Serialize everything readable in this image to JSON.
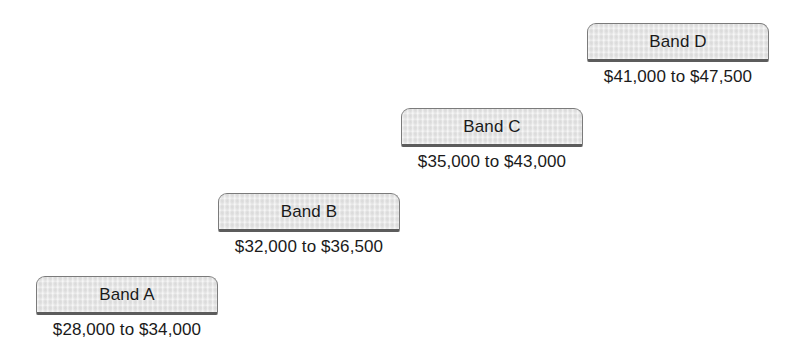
{
  "chart_data": {
    "type": "bar",
    "title": "",
    "subtitle": "",
    "xlabel": "",
    "ylabel": "",
    "categories": [
      "Band A",
      "Band B",
      "Band C",
      "Band D"
    ],
    "series": [
      {
        "name": "Range minimum",
        "values": [
          28000,
          32000,
          35000,
          41000
        ]
      },
      {
        "name": "Range maximum",
        "values": [
          34000,
          36500,
          43000,
          47500
        ]
      }
    ],
    "annotations": [
      "$28,000 to $34,000",
      "$32,000 to $36,500",
      "$35,000 to $43,000",
      "$41,000 to $47,500"
    ],
    "grid": false,
    "legend": "none",
    "ylim": [
      28000,
      47500
    ]
  },
  "diagram": {
    "background_color": "#ffffff",
    "box_fill_color": "#e9e9e9",
    "box_border_color": "#7b7b7b",
    "text_color": "#1a1a1a",
    "bands": [
      {
        "label": "Band A",
        "range_text": "$28,000 to $34,000",
        "range_min": 28000,
        "range_max": 34000
      },
      {
        "label": "Band B",
        "range_text": "$32,000 to $36,500",
        "range_min": 32000,
        "range_max": 36500
      },
      {
        "label": "Band C",
        "range_text": "$35,000 to $43,000",
        "range_min": 35000,
        "range_max": 43000
      },
      {
        "label": "Band D",
        "range_text": "$41,000 to $47,500",
        "range_min": 41000,
        "range_max": 47500
      }
    ]
  }
}
